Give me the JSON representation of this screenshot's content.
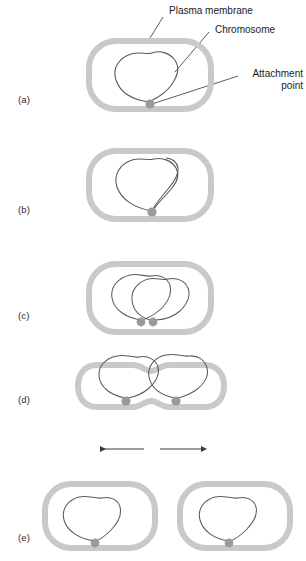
{
  "figure": {
    "title_semantic": "bacterial-binary-fission-stages",
    "background_color": "#ffffff",
    "membrane_color": "#c9c9c9",
    "chromosome_color": "#5a5a5a",
    "attachment_point_color": "#9a9a9a",
    "arrow_color": "#3a3a3a",
    "leader_line_color": "#333333"
  },
  "callouts": [
    {
      "id": "plasma-membrane",
      "label": "Plasma membrane",
      "align": "left"
    },
    {
      "id": "chromosome",
      "label": "Chromosome",
      "align": "left"
    },
    {
      "id": "attachment-point",
      "label": "Attachment\npoint",
      "line1": "Attachment",
      "line2": "point",
      "align": "right"
    }
  ],
  "panels": [
    {
      "id": "a",
      "label": "(a)",
      "attachment_points": 1,
      "cells": 1,
      "arrows": 0
    },
    {
      "id": "b",
      "label": "(b)",
      "attachment_points": 1,
      "cells": 1,
      "arrows": 0
    },
    {
      "id": "c",
      "label": "(c)",
      "attachment_points": 2,
      "cells": 1,
      "arrows": 0
    },
    {
      "id": "d",
      "label": "(d)",
      "attachment_points": 2,
      "cells": 1,
      "arrows": 2
    },
    {
      "id": "e",
      "label": "(e)",
      "attachment_points": 2,
      "cells": 2,
      "arrows": 0
    }
  ]
}
